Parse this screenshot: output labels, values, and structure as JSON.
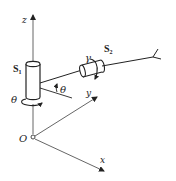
{
  "figure": {
    "type": "kinematic-joint-diagram",
    "colors": {
      "stroke": "#333333",
      "axis": "#555555",
      "background": "#ffffff"
    }
  },
  "axes": {
    "z_label": "z",
    "y_label": "y",
    "x_label": "x",
    "origin_label": "O"
  },
  "joints": {
    "s1": {
      "label": "S",
      "subscript": "1",
      "angle_label": "θ"
    },
    "s2": {
      "label": "S",
      "subscript": "2",
      "angle_label": "γ"
    }
  },
  "arm": {
    "angle_label": "θ"
  }
}
